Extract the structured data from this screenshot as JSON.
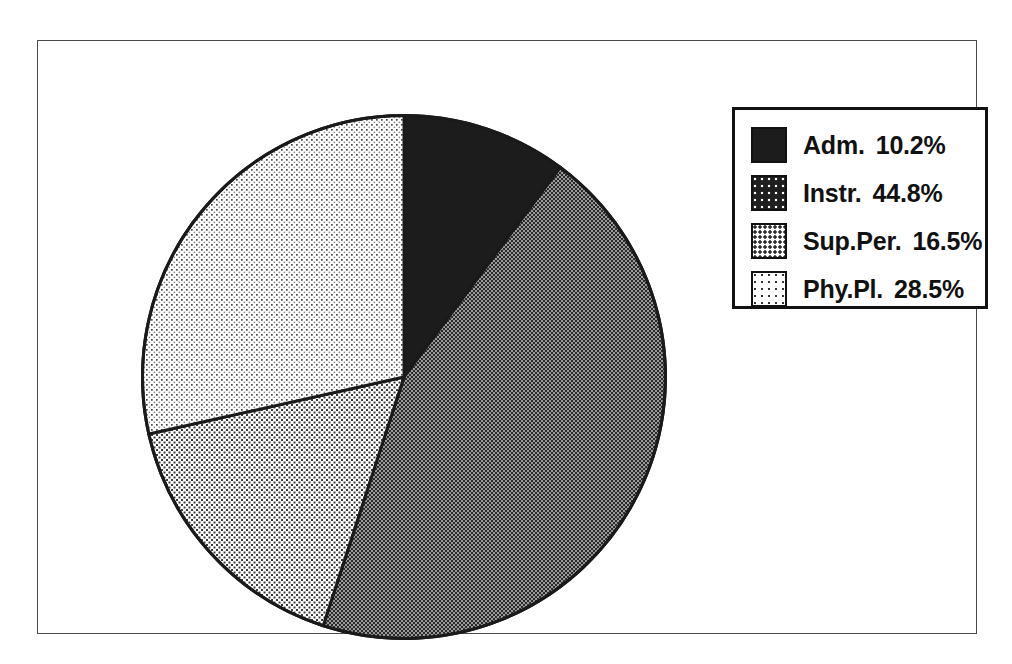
{
  "figure": {
    "background_color": "#ffffff",
    "frame_color": "#4a4a4a"
  },
  "legend": {
    "border_color": "#111111",
    "position": "top-right"
  },
  "chart_data": {
    "type": "pie",
    "title": "",
    "subtitle": "",
    "xlabel": "",
    "ylabel": "",
    "grid": false,
    "legend_position": "top-right",
    "start_angle_deg": 0,
    "direction": "clockwise",
    "units": "percent",
    "categories": [
      "Adm.",
      "Instr.",
      "Sup.Per.",
      "Phy.Pl."
    ],
    "values": [
      10.2,
      44.8,
      16.5,
      28.5
    ],
    "value_labels": [
      "10.2%",
      "44.8%",
      "16.5%",
      "28.5%"
    ],
    "slices": [
      {
        "label": "Adm.",
        "value": 10.2,
        "value_label": "10.2%",
        "fill": "solid-black",
        "color": "#1c1c1c",
        "start_deg": 0.0,
        "end_deg": 36.7
      },
      {
        "label": "Instr.",
        "value": 44.8,
        "value_label": "44.8%",
        "fill": "dense-checker-dark",
        "color": "#6b6b6b",
        "start_deg": 36.7,
        "end_deg": 198.0
      },
      {
        "label": "Sup.Per.",
        "value": 16.5,
        "value_label": "16.5%",
        "fill": "checker-medium",
        "color": "#bdbdbd",
        "start_deg": 198.0,
        "end_deg": 257.4
      },
      {
        "label": "Phy.Pl.",
        "value": 28.5,
        "value_label": "28.5%",
        "fill": "sparse-dots-light",
        "color": "#d9d9d9",
        "start_deg": 257.4,
        "end_deg": 360.0
      }
    ]
  }
}
